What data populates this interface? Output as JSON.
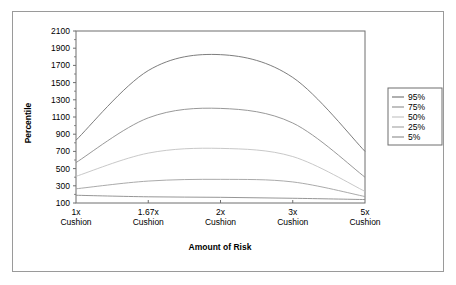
{
  "chart_data": {
    "type": "line",
    "title": "",
    "xlabel": "Amount of Risk",
    "ylabel": "Percentile",
    "categories": [
      "1x\nCushion",
      "1.67x\nCushion",
      "2x\nCushion",
      "3x\nCushion",
      "5x\nCushion"
    ],
    "x_tick_labels_line1": [
      "1x",
      "1.67x",
      "2x",
      "3x",
      "5x"
    ],
    "x_tick_labels_line2": [
      "Cushion",
      "Cushion",
      "Cushion",
      "Cushion",
      "Cushion"
    ],
    "x": [
      1,
      1.67,
      2,
      3,
      5
    ],
    "ylim": [
      100,
      2100
    ],
    "y_ticks": [
      100,
      300,
      500,
      700,
      900,
      1100,
      1300,
      1500,
      1700,
      1900,
      2100
    ],
    "y_tick_labels": [
      "100",
      "300",
      "500",
      "700",
      "900",
      "1100",
      "1300",
      "1500",
      "1700",
      "1900",
      "2100"
    ],
    "grid": false,
    "legend_position": "right",
    "series": [
      {
        "name": "95%",
        "color": "#6e6e6e",
        "values": [
          830,
          1640,
          1825,
          1560,
          700
        ]
      },
      {
        "name": "75%",
        "color": "#8c8c8c",
        "values": [
          570,
          1090,
          1200,
          1030,
          400
        ]
      },
      {
        "name": "50%",
        "color": "#c2c2c2",
        "values": [
          410,
          680,
          735,
          640,
          235
        ]
      },
      {
        "name": "25%",
        "color": "#a0a0a0",
        "values": [
          265,
          355,
          375,
          345,
          175
        ]
      },
      {
        "name": "5%",
        "color": "#8a8a8a",
        "values": [
          190,
          172,
          166,
          155,
          140
        ]
      }
    ]
  },
  "legend": {
    "entries": [
      "95%",
      "75%",
      "50%",
      "25%",
      "5%"
    ]
  },
  "colors": {
    "frame": "#9a9a9a",
    "axis": "#6f6f6f",
    "text": "#000000",
    "background": "#ffffff"
  }
}
